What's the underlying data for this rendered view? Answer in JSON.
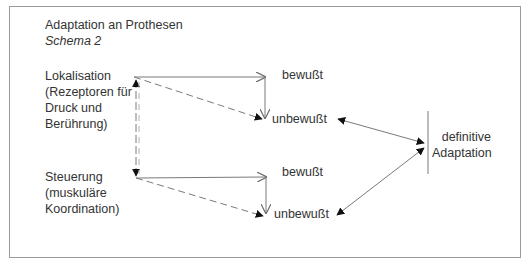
{
  "title": "Adaptation an Prothesen",
  "subtitle": "Schema 2",
  "nodes": {
    "lokalisation": {
      "lines": [
        "Lokalisation",
        "(Rezeptoren für",
        "Druck und",
        "Berührung)"
      ]
    },
    "steuerung": {
      "lines": [
        "Steuerung",
        "(muskuläre",
        "Koordination)"
      ]
    },
    "top_bewusst": "bewußt",
    "top_unbewusst": "unbewußt",
    "bottom_bewusst": "bewußt",
    "bottom_unbewusst": "unbewußt",
    "definitive": {
      "lines": [
        "definitive",
        "Adaptation"
      ]
    }
  },
  "edges": [
    {
      "from": "lokalisation",
      "to": "top_bewusst",
      "style": "solid",
      "head": "open"
    },
    {
      "from": "top_bewusst",
      "to": "top_unbewusst",
      "style": "solid",
      "head": "open"
    },
    {
      "from": "lokalisation",
      "to": "top_unbewusst",
      "style": "dashed",
      "head": "filled"
    },
    {
      "from": "lokalisation",
      "to": "steuerung",
      "style": "dashed",
      "head": "filled-both"
    },
    {
      "from": "steuerung",
      "to": "bottom_bewusst",
      "style": "solid",
      "head": "open"
    },
    {
      "from": "bottom_bewusst",
      "to": "bottom_unbewusst",
      "style": "solid",
      "head": "open"
    },
    {
      "from": "steuerung",
      "to": "bottom_unbewusst",
      "style": "dashed",
      "head": "filled"
    },
    {
      "from": "top_unbewusst",
      "to": "definitive",
      "style": "solid",
      "head": "filled-both"
    },
    {
      "from": "bottom_unbewusst",
      "to": "definitive",
      "style": "solid",
      "head": "filled-both"
    }
  ],
  "colors": {
    "line": "#7a7a7a",
    "text": "#333333",
    "frame": "#9a9a9a"
  }
}
